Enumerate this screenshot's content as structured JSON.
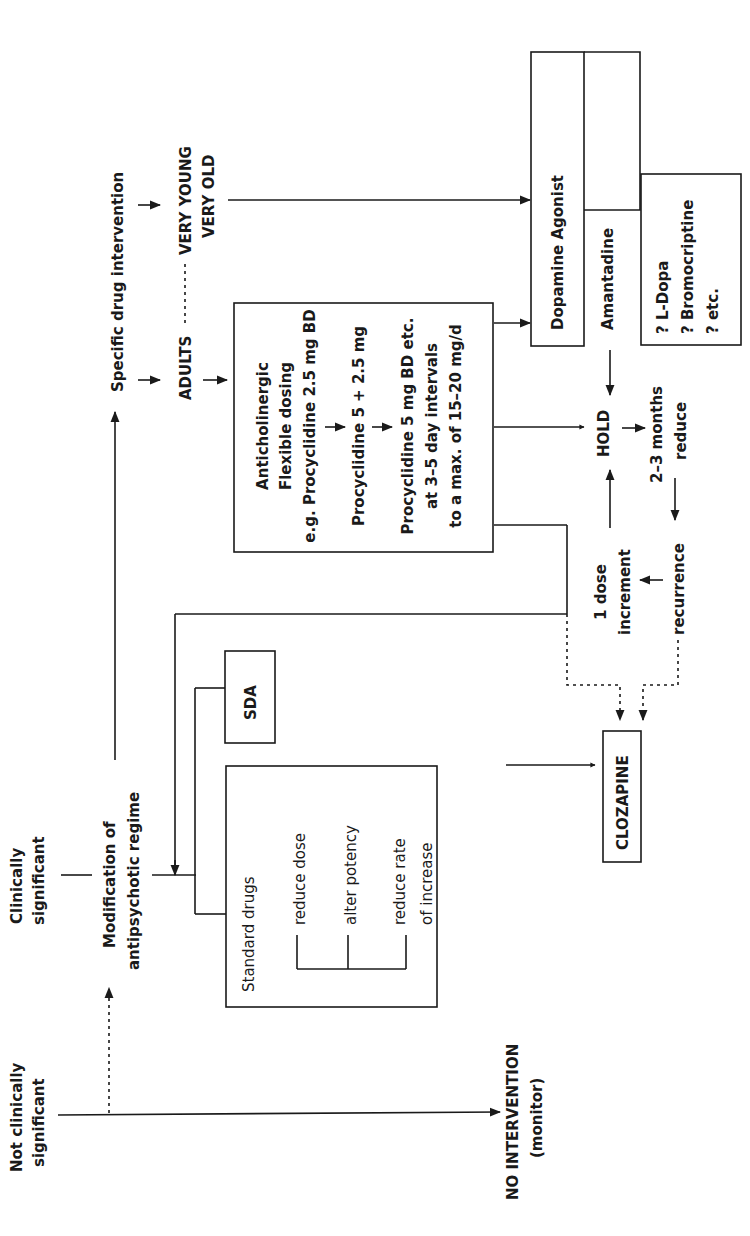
{
  "diagram": {
    "orientation": "rotated 90° counter-clockwise",
    "colors": {
      "ink": "#1a1a1a",
      "background": "#ffffff"
    },
    "triage": {
      "not_significant": [
        "Not clinically",
        "significant"
      ],
      "significant": [
        "Clinically",
        "significant"
      ]
    },
    "no_intervention": [
      "NO INTERVENTION",
      "(monitor)"
    ],
    "modification": [
      "Modification of",
      "antipsychotic regime"
    ],
    "specific_drug": "Specific drug intervention",
    "adults": "ADULTS",
    "very_young_old": [
      "VERY YOUNG",
      "VERY OLD"
    ],
    "anticholinergic_box": {
      "lines": [
        "Anticholinergic",
        "Flexible dosing",
        "e.g. Procyclidine 2.5 mg BD",
        "Procyclidine 5 + 2.5 mg",
        "Procyclidine 5 mg BD etc.",
        "at 3–5 day intervals",
        "to a max. of 15–20 mg/d"
      ]
    },
    "standard_drugs_box": {
      "title": "Standard drugs",
      "options": [
        "reduce dose",
        "alter potency",
        "reduce rate",
        "of increase"
      ]
    },
    "sda_box": "SDA",
    "clozapine_box": "CLOZAPINE",
    "dopamine_agonist_box": {
      "title": "Dopamine Agonist",
      "amantadine": "Amantadine",
      "others": [
        "? L-Dopa",
        "? Bromocriptine",
        "? etc."
      ]
    },
    "hold_cycle": {
      "hold": "HOLD",
      "reduce": [
        "2–3 months",
        "reduce"
      ],
      "recurrence": "recurrence",
      "increment": [
        "1 dose",
        "increment"
      ]
    }
  }
}
